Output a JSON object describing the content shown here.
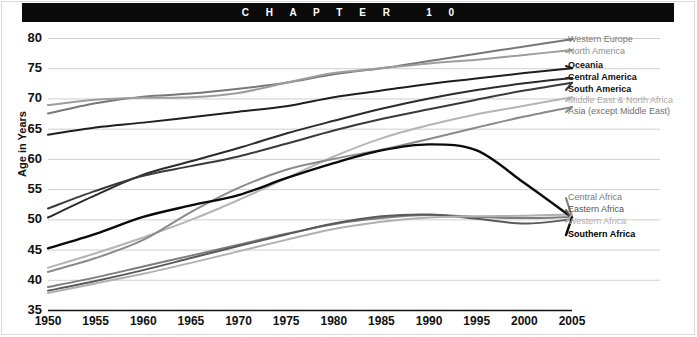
{
  "header": {
    "chapter_text": "C H A P T E R   1 0"
  },
  "chart_data": {
    "type": "line",
    "title": "",
    "xlabel": "",
    "ylabel": "Age in Years",
    "xlim": [
      1950,
      2005
    ],
    "ylim": [
      35,
      80
    ],
    "ytick_values": [
      80,
      75,
      70,
      65,
      60,
      55,
      50,
      45,
      40,
      35
    ],
    "xtick_values": [
      1950,
      1955,
      1960,
      1965,
      1970,
      1975,
      1980,
      1985,
      1990,
      1995,
      2000,
      2005
    ],
    "grid": true,
    "legend_position": "right-inline",
    "x": [
      1950,
      1955,
      1960,
      1965,
      1970,
      1975,
      1980,
      1985,
      1990,
      1995,
      2000,
      2005
    ],
    "series": [
      {
        "name": "Western Europe",
        "color": "#777777",
        "width": 2.0,
        "label_color": "#7a7a7a",
        "label_bold": false,
        "values": [
          67.5,
          69.2,
          70.3,
          70.8,
          71.6,
          72.6,
          74.0,
          75.0,
          76.2,
          77.4,
          78.6,
          79.8
        ]
      },
      {
        "name": "North America",
        "color": "#9d9d9d",
        "width": 2.0,
        "label_color": "#8e8e8e",
        "label_bold": false,
        "values": [
          68.9,
          69.8,
          70.1,
          70.2,
          70.9,
          72.6,
          74.2,
          75.0,
          75.8,
          76.4,
          77.2,
          78.0
        ]
      },
      {
        "name": "Oceania",
        "color": "#1e1e1e",
        "width": 2.0,
        "label_color": "#111111",
        "label_bold": true,
        "values": [
          64.0,
          65.2,
          66.0,
          66.9,
          67.8,
          68.7,
          70.2,
          71.3,
          72.4,
          73.3,
          74.2,
          75.0
        ]
      },
      {
        "name": "Central America",
        "color": "#2b2b2b",
        "width": 2.0,
        "label_color": "#111111",
        "label_bold": true,
        "values": [
          50.3,
          54.0,
          57.4,
          59.6,
          61.8,
          64.2,
          66.3,
          68.3,
          70.0,
          71.4,
          72.5,
          73.4
        ]
      },
      {
        "name": "South America",
        "color": "#3a3a3a",
        "width": 2.0,
        "label_color": "#111111",
        "label_bold": true,
        "values": [
          51.8,
          54.7,
          57.2,
          58.8,
          60.4,
          62.5,
          64.7,
          66.6,
          68.2,
          69.8,
          71.3,
          72.6
        ]
      },
      {
        "name": "Middle East & North Africa",
        "color": "#b5b5b5",
        "width": 2.0,
        "label_color": "#ababab",
        "label_bold": false,
        "values": [
          42.0,
          44.4,
          47.0,
          49.9,
          53.2,
          56.8,
          60.4,
          63.4,
          65.6,
          67.4,
          68.8,
          70.2
        ]
      },
      {
        "name": "Asia (except Middle East)",
        "color": "#8a8a8a",
        "width": 2.0,
        "label_color": "#6f6f6f",
        "label_bold": false,
        "values": [
          41.3,
          43.6,
          46.6,
          51.2,
          55.2,
          58.2,
          60.0,
          61.5,
          63.3,
          65.2,
          67.0,
          68.6
        ]
      },
      {
        "name": "Central Africa",
        "color": "#7d7d7d",
        "width": 2.0,
        "label_color": "#7a7a7a",
        "label_bold": false,
        "values": [
          38.8,
          40.4,
          42.2,
          44.0,
          45.8,
          47.6,
          49.2,
          50.2,
          50.7,
          50.4,
          50.2,
          50.4
        ]
      },
      {
        "name": "Eastern Africa",
        "color": "#5a5a5a",
        "width": 2.0,
        "label_color": "#555555",
        "label_bold": false,
        "values": [
          38.2,
          39.8,
          41.6,
          43.6,
          45.6,
          47.5,
          49.3,
          50.5,
          50.8,
          50.1,
          49.3,
          50.0
        ]
      },
      {
        "name": "Western Africa",
        "color": "#b0b0b0",
        "width": 2.0,
        "label_color": "#b0b0b0",
        "label_bold": false,
        "values": [
          37.8,
          39.4,
          41.0,
          42.8,
          44.7,
          46.6,
          48.4,
          49.6,
          50.3,
          50.5,
          50.6,
          50.8
        ]
      },
      {
        "name": "Southern Africa",
        "color": "#0a0a0a",
        "width": 2.4,
        "label_color": "#000000",
        "label_bold": true,
        "values": [
          45.2,
          47.6,
          50.4,
          52.3,
          54.0,
          56.8,
          59.3,
          61.4,
          62.4,
          61.4,
          56.0,
          50.3
        ]
      }
    ]
  }
}
